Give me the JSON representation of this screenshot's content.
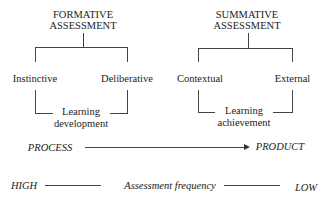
{
  "formative": {
    "title_line1": "FORMATIVE",
    "title_line2": "ASSESSMENT",
    "left_child": "Instinctive",
    "right_child": "Deliberative",
    "outcome_line1": "Learning",
    "outcome_line2": "development"
  },
  "summative": {
    "title_line1": "SUMMATIVE",
    "title_line2": "ASSESSMENT",
    "left_child": "Contextual",
    "right_child": "External",
    "outcome_line1": "Learning",
    "outcome_line2": "achievement"
  },
  "process_axis": {
    "start_label": "PROCESS",
    "end_label": "PRODUCT"
  },
  "frequency_axis": {
    "start_label": "HIGH",
    "center_label": "Assessment frequency",
    "end_label": "LOW"
  }
}
